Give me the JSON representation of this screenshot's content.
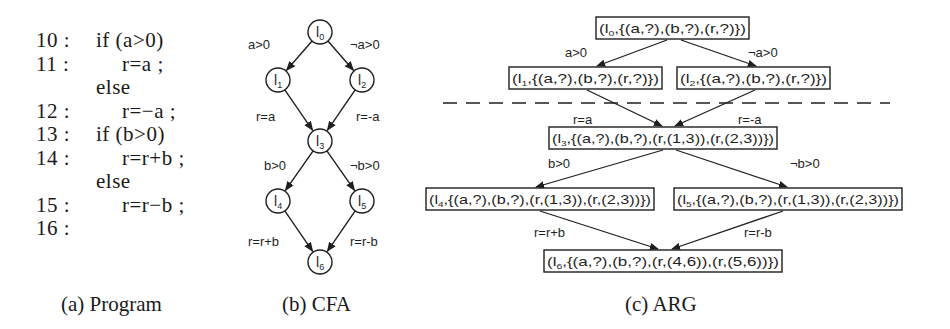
{
  "program": {
    "caption": "(a) Program",
    "lines": [
      {
        "label": "10 :",
        "code": "if (a>0)",
        "indent": 0
      },
      {
        "label": "11 :",
        "code": "r=a ;",
        "indent": 1
      },
      {
        "label": "",
        "code": "else",
        "indent": 0
      },
      {
        "label": "12 :",
        "code": "r=−a ;",
        "indent": 1
      },
      {
        "label": "13 :",
        "code": "if (b>0)",
        "indent": 0
      },
      {
        "label": "14 :",
        "code": "r=r+b ;",
        "indent": 1
      },
      {
        "label": "",
        "code": "else",
        "indent": 0
      },
      {
        "label": "15 :",
        "code": "r=r−b ;",
        "indent": 1
      },
      {
        "label": "16 :",
        "code": "",
        "indent": 0
      }
    ]
  },
  "cfa": {
    "caption": "(b) CFA",
    "nodes": [
      {
        "id": "l0",
        "base": "l",
        "sub": "0",
        "x": 320,
        "y": 32
      },
      {
        "id": "l1",
        "base": "l",
        "sub": "1",
        "x": 278,
        "y": 80
      },
      {
        "id": "l2",
        "base": "l",
        "sub": "2",
        "x": 362,
        "y": 80
      },
      {
        "id": "l3",
        "base": "l",
        "sub": "3",
        "x": 320,
        "y": 141
      },
      {
        "id": "l4",
        "base": "l",
        "sub": "4",
        "x": 278,
        "y": 201
      },
      {
        "id": "l5",
        "base": "l",
        "sub": "5",
        "x": 362,
        "y": 201
      },
      {
        "id": "l6",
        "base": "l",
        "sub": "6",
        "x": 320,
        "y": 262
      }
    ],
    "edges": [
      {
        "from": "l0",
        "to": "l1",
        "label": "a>0",
        "lx": 248,
        "ly": 49,
        "anchor": "start"
      },
      {
        "from": "l0",
        "to": "l2",
        "label": "¬a>0",
        "lx": 350,
        "ly": 49,
        "anchor": "start"
      },
      {
        "from": "l1",
        "to": "l3",
        "label": "r=a",
        "lx": 256,
        "ly": 121,
        "anchor": "start"
      },
      {
        "from": "l2",
        "to": "l3",
        "label": "r=-a",
        "lx": 356,
        "ly": 121,
        "anchor": "start"
      },
      {
        "from": "l3",
        "to": "l4",
        "label": "b>0",
        "lx": 264,
        "ly": 170,
        "anchor": "start"
      },
      {
        "from": "l3",
        "to": "l5",
        "label": "¬b>0",
        "lx": 350,
        "ly": 170,
        "anchor": "start"
      },
      {
        "from": "l4",
        "to": "l6",
        "label": "r=r+b",
        "lx": 248,
        "ly": 246,
        "anchor": "start"
      },
      {
        "from": "l5",
        "to": "l6",
        "label": "r=r-b",
        "lx": 350,
        "ly": 246,
        "anchor": "start"
      }
    ]
  },
  "arg": {
    "caption": "(c) ARG",
    "nodes": [
      {
        "id": "n0",
        "loc": "0",
        "text": ",{(a,?),(b,?),(r,?)})",
        "x": 596,
        "y": 17,
        "w": 153
      },
      {
        "id": "n1",
        "loc": "1",
        "text": ",{(a,?),(b,?),(r,?)})",
        "x": 509,
        "y": 67,
        "w": 153
      },
      {
        "id": "n2",
        "loc": "2",
        "text": ",{(a,?),(b,?),(r,?)})",
        "x": 677,
        "y": 67,
        "w": 153
      },
      {
        "id": "n3",
        "loc": "3",
        "text": ",{(a,?),(b,?),(r,(1,3)),(r,(2,3))})",
        "x": 549,
        "y": 127,
        "w": 228
      },
      {
        "id": "n4",
        "loc": "4",
        "text": ",{(a,?),(b,?),(r,(1,3)),(r,(2,3))})",
        "x": 426,
        "y": 188,
        "w": 228
      },
      {
        "id": "n5",
        "loc": "5",
        "text": ",{(a,?),(b,?),(r,(1,3)),(r,(2,3))})",
        "x": 674,
        "y": 188,
        "w": 228
      },
      {
        "id": "n6",
        "loc": "6",
        "text": ",{(a,?),(b,?),(r,(4,6)),(r,(5,6))})",
        "x": 544,
        "y": 250,
        "w": 238
      }
    ],
    "edges": [
      {
        "from": "n0",
        "to": "n1",
        "fx": 667,
        "fy": 40,
        "tx": 597,
        "ty": 66,
        "label": "a>0",
        "lx": 565,
        "ly": 57
      },
      {
        "from": "n0",
        "to": "n2",
        "fx": 681,
        "fy": 40,
        "tx": 756,
        "ty": 66,
        "label": "¬a>0",
        "lx": 748,
        "ly": 57
      },
      {
        "from": "n1",
        "to": "n3",
        "fx": 587,
        "fy": 90,
        "tx": 662,
        "ty": 126,
        "label": "r=a",
        "lx": 573,
        "ly": 124
      },
      {
        "from": "n2",
        "to": "n3",
        "fx": 755,
        "fy": 90,
        "tx": 675,
        "ty": 126,
        "label": "r=-a",
        "lx": 738,
        "ly": 124
      },
      {
        "from": "n3",
        "to": "n4",
        "fx": 663,
        "fy": 150,
        "tx": 536,
        "ty": 187,
        "label": "b>0",
        "lx": 548,
        "ly": 168
      },
      {
        "from": "n3",
        "to": "n5",
        "fx": 676,
        "fy": 150,
        "tx": 787,
        "ty": 187,
        "label": "¬b>0",
        "lx": 790,
        "ly": 168
      },
      {
        "from": "n4",
        "to": "n6",
        "fx": 540,
        "fy": 211,
        "tx": 658,
        "ty": 249,
        "label": "r=r+b",
        "lx": 534,
        "ly": 237
      },
      {
        "from": "n5",
        "to": "n6",
        "fx": 783,
        "fy": 211,
        "tx": 672,
        "ty": 249,
        "label": "r=r-b",
        "lx": 744,
        "ly": 237
      }
    ],
    "divider": {
      "x1": 443,
      "x2": 890,
      "y": 103,
      "style": "dashed"
    }
  },
  "colors": {
    "ink": "#1f1f1f",
    "background": "#ffffff"
  }
}
